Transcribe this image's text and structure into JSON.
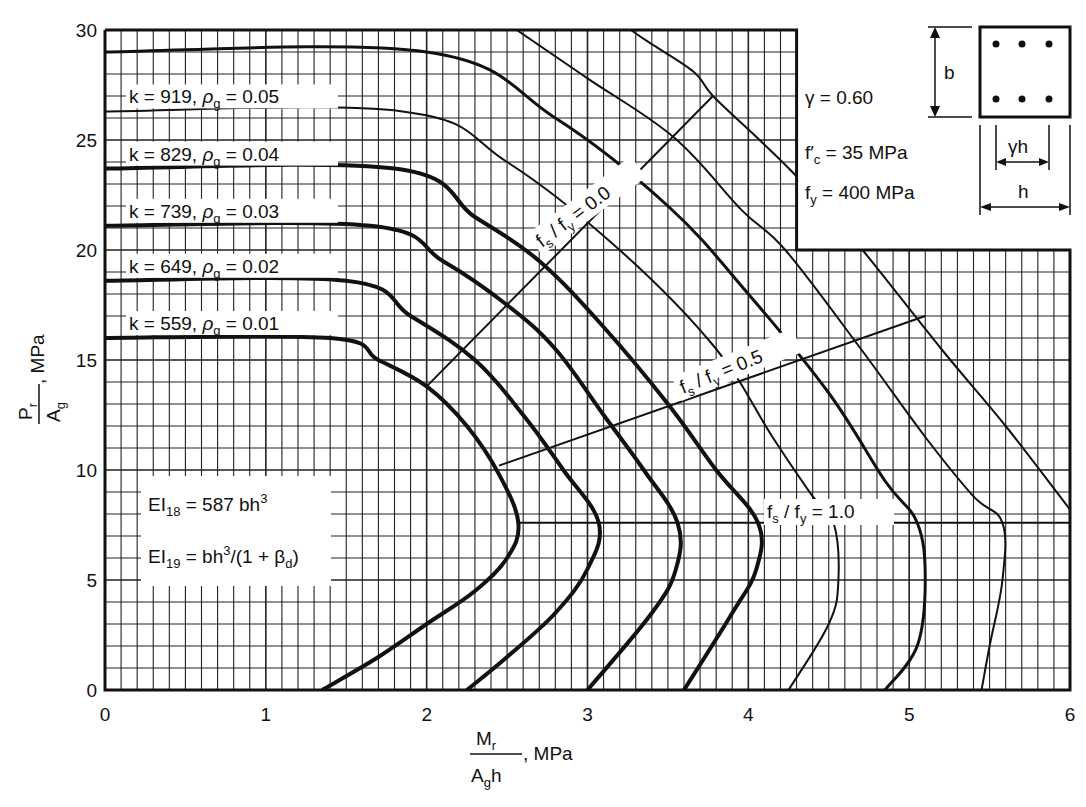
{
  "chart_data": {
    "type": "line",
    "title": "",
    "xlabel": "Mr / (Ag h), MPa",
    "ylabel": "Pr / Ag, MPa",
    "xlim": [
      0,
      6
    ],
    "ylim": [
      0,
      30
    ],
    "x_ticks": [
      0,
      1,
      2,
      3,
      4,
      5,
      6
    ],
    "y_ticks": [
      0,
      5,
      10,
      15,
      20,
      25,
      30
    ],
    "grid": {
      "on": true,
      "x_minor_step": 0.1,
      "y_minor_step": 1
    },
    "blank_region": {
      "x_from": 4.3,
      "y_from": 20
    },
    "parameters": {
      "gamma": "γ = 0.60",
      "fc": "f′c = 35 MPa",
      "fy": "fy = 400 MPa"
    },
    "stiffness_notes": [
      "EI18 = 587 bh³",
      "EI19 = bh³/(1 + βd)"
    ],
    "series": [
      {
        "name": "k = 559, ρg = 0.01",
        "k": 559,
        "rho_g": 0.01,
        "weight": "thick",
        "points": [
          [
            0,
            16
          ],
          [
            1.4,
            16
          ],
          [
            1.7,
            15
          ],
          [
            2.0,
            13.8
          ],
          [
            2.25,
            12
          ],
          [
            2.45,
            9.8
          ],
          [
            2.57,
            7.6
          ],
          [
            2.5,
            6
          ],
          [
            2.3,
            4.5
          ],
          [
            2.0,
            3
          ],
          [
            1.7,
            1.5
          ],
          [
            1.35,
            0
          ]
        ]
      },
      {
        "name": "k = 649, ρg = 0.02",
        "k": 649,
        "rho_g": 0.02,
        "weight": "thick",
        "points": [
          [
            0,
            18.6
          ],
          [
            1.5,
            18.6
          ],
          [
            1.9,
            17
          ],
          [
            2.3,
            15
          ],
          [
            2.6,
            12.5
          ],
          [
            2.85,
            10
          ],
          [
            3.07,
            7.6
          ],
          [
            3.0,
            5.5
          ],
          [
            2.8,
            3.5
          ],
          [
            2.5,
            1.5
          ],
          [
            2.25,
            0
          ]
        ]
      },
      {
        "name": "k = 739, ρg = 0.03",
        "k": 739,
        "rho_g": 0.03,
        "weight": "thick",
        "points": [
          [
            0,
            21.1
          ],
          [
            1.65,
            21.1
          ],
          [
            2.1,
            19.5
          ],
          [
            2.5,
            17.5
          ],
          [
            2.8,
            15.5
          ],
          [
            3.1,
            12.5
          ],
          [
            3.35,
            10
          ],
          [
            3.56,
            7.6
          ],
          [
            3.55,
            5.5
          ],
          [
            3.4,
            3.5
          ],
          [
            3.0,
            0
          ]
        ]
      },
      {
        "name": "k = 829, ρg = 0.04",
        "k": 829,
        "rho_g": 0.04,
        "weight": "thick",
        "points": [
          [
            0,
            23.7
          ],
          [
            1.8,
            23.7
          ],
          [
            2.3,
            21.5
          ],
          [
            2.7,
            19.5
          ],
          [
            3.1,
            16.5
          ],
          [
            3.5,
            13
          ],
          [
            3.8,
            10
          ],
          [
            4.06,
            7.6
          ],
          [
            4.05,
            5.5
          ],
          [
            3.9,
            3.5
          ],
          [
            3.6,
            0
          ]
        ]
      },
      {
        "name": "k = 919, ρg = 0.05",
        "k": 919,
        "rho_g": 0.05,
        "weight": "thin",
        "points": [
          [
            0,
            26.3
          ],
          [
            1.85,
            26.3
          ],
          [
            2.5,
            24
          ],
          [
            3.2,
            20
          ],
          [
            3.8,
            15.5
          ],
          [
            4.15,
            11.5
          ],
          [
            4.4,
            8.8
          ],
          [
            4.53,
            7.6
          ],
          [
            4.56,
            5
          ],
          [
            4.5,
            3
          ],
          [
            4.25,
            0
          ]
        ]
      },
      {
        "name": "ρg = 0.06",
        "rho_g": 0.06,
        "weight": "medium",
        "points": [
          [
            0,
            29
          ],
          [
            2.0,
            29
          ],
          [
            2.8,
            26
          ],
          [
            3.5,
            22
          ],
          [
            4.0,
            18
          ],
          [
            4.5,
            13.5
          ],
          [
            4.85,
            9.5
          ],
          [
            5.05,
            7.6
          ],
          [
            5.1,
            5
          ],
          [
            5.05,
            2
          ],
          [
            4.85,
            0
          ]
        ]
      },
      {
        "name": "ρg = 0.07",
        "rho_g": 0.07,
        "weight": "thin",
        "points": [
          [
            2.56,
            30
          ],
          [
            3.0,
            27.8
          ],
          [
            3.54,
            25.1
          ],
          [
            3.96,
            21.8
          ],
          [
            4.23,
            20
          ],
          [
            4.7,
            15.5
          ],
          [
            5.1,
            11.5
          ],
          [
            5.4,
            8.8
          ],
          [
            5.58,
            7.6
          ],
          [
            5.58,
            5
          ],
          [
            5.5,
            2
          ],
          [
            5.45,
            0
          ]
        ]
      },
      {
        "name": "ρg = 0.08",
        "rho_g": 0.08,
        "weight": "thin",
        "points": [
          [
            3.27,
            30
          ],
          [
            3.39,
            29.4
          ],
          [
            3.66,
            28.1
          ],
          [
            3.78,
            27
          ],
          [
            4.07,
            25
          ],
          [
            4.28,
            23.5
          ],
          [
            4.5,
            21.7
          ],
          [
            4.71,
            20
          ],
          [
            5.2,
            15.5
          ],
          [
            5.6,
            12
          ],
          [
            6.0,
            8.2
          ]
        ]
      }
    ],
    "reference_lines": [
      {
        "name": "fs / fy = 0.0",
        "points": [
          [
            2.0,
            13.8
          ],
          [
            3.78,
            27.0
          ]
        ]
      },
      {
        "name": "fs / fy = 0.5",
        "points": [
          [
            2.45,
            10.2
          ],
          [
            5.1,
            17.0
          ]
        ]
      },
      {
        "name": "fs / fy = 1.0",
        "points": [
          [
            2.57,
            7.6
          ],
          [
            6.0,
            7.6
          ]
        ]
      }
    ]
  },
  "labels": {
    "series": [
      {
        "k": "k = 919,",
        "rho": "ρ",
        "rho_sub": "g",
        "val": "= 0.05"
      },
      {
        "k": "k = 829,",
        "rho": "ρ",
        "rho_sub": "g",
        "val": "= 0.04"
      },
      {
        "k": "k = 739,",
        "rho": "ρ",
        "rho_sub": "g",
        "val": "= 0.03"
      },
      {
        "k": "k = 649,",
        "rho": "ρ",
        "rho_sub": "g",
        "val": "= 0.02"
      },
      {
        "k": "k = 559,",
        "rho": "ρ",
        "rho_sub": "g",
        "val": "= 0.01"
      }
    ],
    "fs0": {
      "a": "f",
      "s": "s",
      "b": " / f",
      "y": "y",
      "c": " = 0.0"
    },
    "fs05": {
      "a": "f",
      "s": "s",
      "b": " / f",
      "y": "y",
      "c": " = 0.5"
    },
    "fs1": {
      "a": "f",
      "s": "s",
      "b": " / f",
      "y": "y",
      "c": " = 1.0"
    },
    "gamma": "γ  =  0.60",
    "fc_main": "f′",
    "fc_sub": "c",
    "fc_rest": " =  35  MPa",
    "fy_main": "f",
    "fy_sub": "y",
    "fy_rest": " = 400  MPa",
    "ei18_main": "EI",
    "ei18_sub": "18",
    "ei18_rest": " = 587 bh",
    "ei18_sup": "3",
    "ei19_main": "EI",
    "ei19_sub": "19",
    "ei19_rest": " = bh",
    "ei19_sup": "3",
    "ei19_tail": "/(1 + β",
    "ei19_beta_sub": "d",
    "ei19_close": ")",
    "dim_b": "b",
    "dim_gh": "γh",
    "dim_h": "h",
    "xaxis_num": "M",
    "xaxis_num_sub": "r",
    "xaxis_den": "A",
    "xaxis_den_sub": "g",
    "xaxis_den_rest": "h",
    "xaxis_unit": ", MPa",
    "yaxis_num": "P",
    "yaxis_num_sub": "r",
    "yaxis_den": "A",
    "yaxis_den_sub": "g",
    "yaxis_unit": ", MPa"
  }
}
